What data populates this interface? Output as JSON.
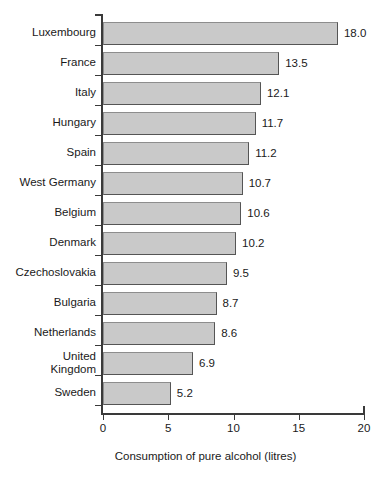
{
  "chart_data": {
    "type": "bar",
    "orientation": "horizontal",
    "title": "",
    "subtitle": "",
    "xlabel": "Consumption of pure alcohol (litres)",
    "ylabel": "",
    "xlim": [
      0,
      20
    ],
    "xticks": [
      "0",
      "5",
      "10",
      "15",
      "20"
    ],
    "xtick_values": [
      0,
      5,
      10,
      15,
      20
    ],
    "grid": false,
    "legend": null,
    "value_labels_shown": true,
    "categories": [
      "Luxembourg",
      "France",
      "Italy",
      "Hungary",
      "Spain",
      "West Germany",
      "Belgium",
      "Denmark",
      "Czechoslovakia",
      "Bulgaria",
      "Netherlands",
      "United\nKingdom",
      "Sweden"
    ],
    "values": [
      18.0,
      13.5,
      12.1,
      11.7,
      11.2,
      10.7,
      10.6,
      10.2,
      9.5,
      8.7,
      8.6,
      6.9,
      5.2
    ],
    "value_labels": [
      "18.0",
      "13.5",
      "12.1",
      "11.7",
      "11.2",
      "10.7",
      "10.6",
      "10.2",
      "9.5",
      "8.7",
      "8.6",
      "6.9",
      "5.2"
    ],
    "colors": {
      "bar_fill": "#c9c9c9",
      "bar_border": "#555555",
      "axis": "#3a3a3a",
      "text": "#1a1a1a",
      "background": "#ffffff"
    }
  }
}
